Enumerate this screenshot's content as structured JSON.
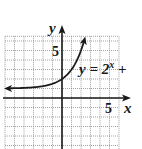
{
  "chart_data": {
    "type": "line",
    "title": "",
    "xlabel": "x",
    "ylabel": "y",
    "xlim": [
      -6,
      6
    ],
    "ylim": [
      -5.5,
      6.5
    ],
    "grid": true,
    "legend_position": "none",
    "x_tick_labels": [
      {
        "value": 5,
        "label": "5"
      }
    ],
    "y_tick_labels": [
      {
        "value": 5,
        "label": "5"
      }
    ],
    "series": [
      {
        "name": "y = 2^x + 1",
        "function": "2^x + 1",
        "asymptote": 1,
        "x": [
          -6,
          -5,
          -4,
          -3,
          -2,
          -1,
          0,
          1,
          2,
          2.3
        ],
        "y": [
          1.016,
          1.031,
          1.063,
          1.125,
          1.25,
          1.5,
          2,
          3,
          5,
          5.92
        ]
      }
    ],
    "annotations": [
      {
        "text_main": "y = 2",
        "superscript": "x",
        "text_tail": " +",
        "x": 2.5,
        "y": 3.3
      }
    ]
  },
  "labels": {
    "x_axis": "x",
    "y_axis": "y",
    "x_tick_5": "5",
    "y_tick_5": "5",
    "eq_main": "y = 2",
    "eq_sup": "x",
    "eq_tail": " +"
  },
  "colors": {
    "grid": "#8a8a8a",
    "axis": "#1a1a1a",
    "curve": "#1a1a1a"
  }
}
